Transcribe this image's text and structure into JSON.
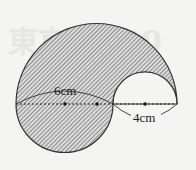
{
  "diagram": {
    "type": "geometry-composite-semicircles",
    "shading": "diagonal-hatch",
    "colors": {
      "background": "#f4f4f2",
      "stroke": "#333333",
      "hatch": "#555555",
      "fill": "#d9d9d9"
    },
    "labels": {
      "left_diameter": "6cm",
      "right_diameter": "4cm"
    },
    "watermark": "東京 2020",
    "shapes": [
      {
        "name": "large-top-semicircle",
        "diameter_span": [
          "left edge",
          "right edge"
        ],
        "shaded": true
      },
      {
        "name": "left-bottom-semicircle",
        "diameter_label": "6cm",
        "shaded": true
      },
      {
        "name": "right-top-semicircle",
        "diameter_label": "4cm",
        "shaded": false
      }
    ],
    "center_points": 3
  }
}
